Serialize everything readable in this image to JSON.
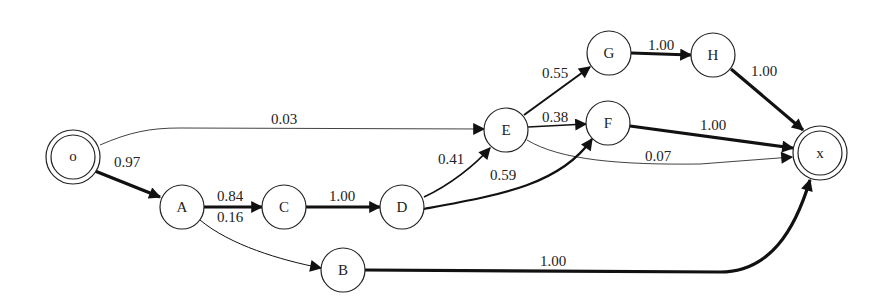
{
  "diagram": {
    "type": "probabilistic state transition graph",
    "nodes": [
      {
        "id": "o",
        "label": "o",
        "x": 73,
        "y": 157,
        "kind": "start"
      },
      {
        "id": "A",
        "label": "A",
        "x": 182,
        "y": 207,
        "kind": "state"
      },
      {
        "id": "C",
        "label": "C",
        "x": 284,
        "y": 207,
        "kind": "state"
      },
      {
        "id": "D",
        "label": "D",
        "x": 402,
        "y": 207,
        "kind": "state"
      },
      {
        "id": "B",
        "label": "B",
        "x": 343,
        "y": 270,
        "kind": "state"
      },
      {
        "id": "E",
        "label": "E",
        "x": 506,
        "y": 130,
        "kind": "state"
      },
      {
        "id": "F",
        "label": "F",
        "x": 608,
        "y": 123,
        "kind": "state"
      },
      {
        "id": "G",
        "label": "G",
        "x": 609,
        "y": 53,
        "kind": "state"
      },
      {
        "id": "H",
        "label": "H",
        "x": 713,
        "y": 55,
        "kind": "state"
      },
      {
        "id": "x",
        "label": "x",
        "x": 820,
        "y": 153,
        "kind": "end"
      }
    ],
    "edges": [
      {
        "from": "o",
        "to": "A",
        "label": "0.97",
        "weight": 3.2
      },
      {
        "from": "o",
        "to": "E",
        "label": "0.03",
        "weight": 0.8
      },
      {
        "from": "A",
        "to": "C",
        "label": "0.84",
        "weight": 2.8
      },
      {
        "from": "A",
        "to": "B",
        "label": "0.16",
        "weight": 1.0
      },
      {
        "from": "C",
        "to": "D",
        "label": "1.00",
        "weight": 3.2
      },
      {
        "from": "D",
        "to": "E",
        "label": "0.41",
        "weight": 1.8
      },
      {
        "from": "D",
        "to": "F",
        "label": "0.59",
        "weight": 2.2
      },
      {
        "from": "E",
        "to": "G",
        "label": "0.55",
        "weight": 2.0
      },
      {
        "from": "E",
        "to": "F",
        "label": "0.38",
        "weight": 1.6
      },
      {
        "from": "E",
        "to": "x",
        "label": "0.07",
        "weight": 0.8
      },
      {
        "from": "G",
        "to": "H",
        "label": "1.00",
        "weight": 3.2
      },
      {
        "from": "H",
        "to": "x",
        "label": "1.00",
        "weight": 3.2
      },
      {
        "from": "F",
        "to": "x",
        "label": "1.00",
        "weight": 3.2
      },
      {
        "from": "B",
        "to": "x",
        "label": "1.00",
        "weight": 3.2
      }
    ]
  }
}
